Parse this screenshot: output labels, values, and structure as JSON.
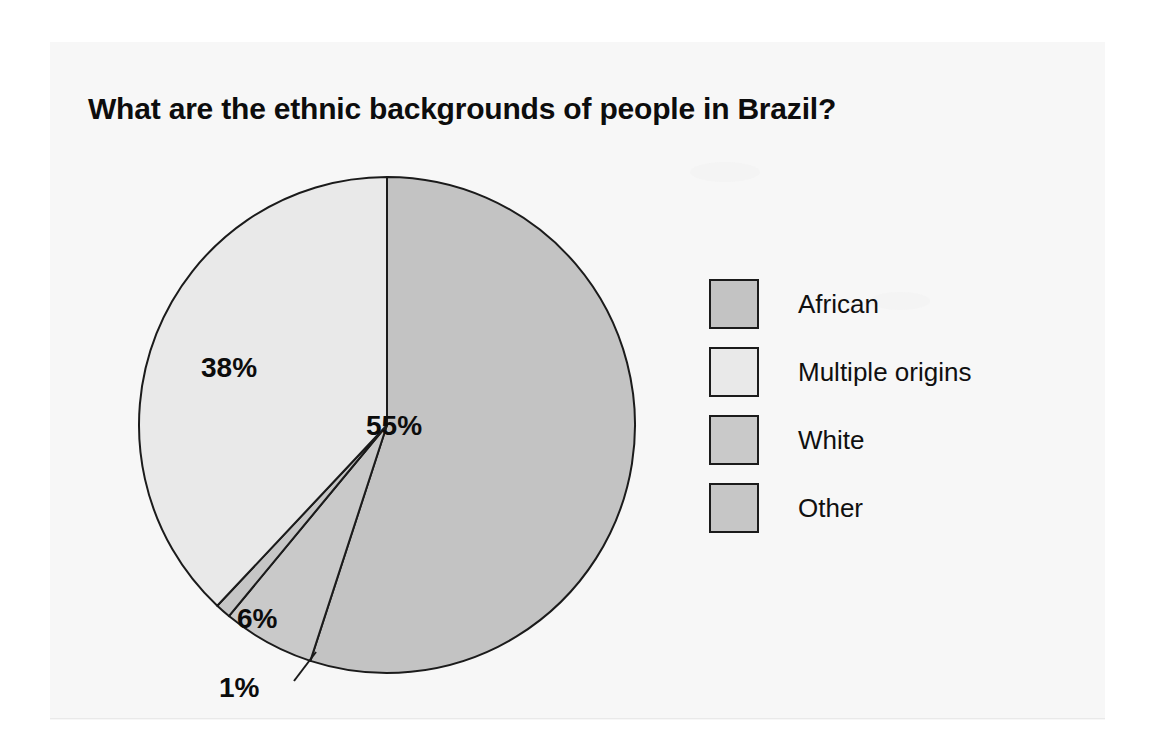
{
  "page": {
    "background_color": "#ffffff",
    "sheet_color": "#f7f7f7"
  },
  "chart_data": {
    "type": "pie",
    "title": "What are the ethnic backgrounds of people in Brazil?",
    "xlabel": "",
    "ylabel": "",
    "unit": "%",
    "start_angle_deg": 0,
    "direction": "clockwise",
    "legend_position": "right",
    "grid": false,
    "categories": [
      "African",
      "Multiple origins",
      "White",
      "Other"
    ],
    "values": [
      55,
      38,
      6,
      1
    ],
    "labels": [
      "55%",
      "38%",
      "6%",
      "1%"
    ],
    "colors": [
      "#c3c3c3",
      "#e9e9e9",
      "#c9c9c9",
      "#c6c6c6"
    ],
    "slice_order_clockwise_from_top": [
      "African",
      "White",
      "Other",
      "Multiple origins"
    ],
    "stroke_color": "#1b1b1b",
    "slices": [
      {
        "name": "African",
        "value": 55,
        "label": "55%",
        "color": "#c3c3c3"
      },
      {
        "name": "Multiple origins",
        "value": 38,
        "label": "38%",
        "color": "#e9e9e9"
      },
      {
        "name": "White",
        "value": 6,
        "label": "6%",
        "color": "#c9c9c9"
      },
      {
        "name": "Other",
        "value": 1,
        "label": "1%",
        "color": "#c6c6c6"
      }
    ]
  },
  "legend": {
    "items": [
      {
        "label": "African",
        "color": "#c3c3c3"
      },
      {
        "label": "Multiple origins",
        "color": "#e9e9e9"
      },
      {
        "label": "White",
        "color": "#c9c9c9"
      },
      {
        "label": "Other",
        "color": "#c6c6c6"
      }
    ]
  }
}
